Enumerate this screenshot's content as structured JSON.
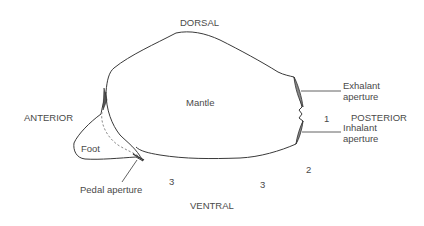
{
  "diagram": {
    "orientation_labels": {
      "dorsal": "DORSAL",
      "ventral": "VENTRAL",
      "anterior": "ANTERIOR",
      "posterior": "POSTERIOR"
    },
    "structure_labels": {
      "mantle": "Mantle",
      "foot": "Foot",
      "pedal_aperture": "Pedal aperture",
      "exhalant_line1": "Exhalant",
      "exhalant_line2": "aperture",
      "inhalant_line1": "Inhalant",
      "inhalant_line2": "aperture"
    },
    "fusion_markers": {
      "m1": "1",
      "m2": "2",
      "m3a": "3",
      "m3b": "3"
    },
    "colors": {
      "outline": "#3a3a3a",
      "text": "#4a4a4a",
      "dashed": "#8a8a8a",
      "background": "#ffffff"
    }
  }
}
